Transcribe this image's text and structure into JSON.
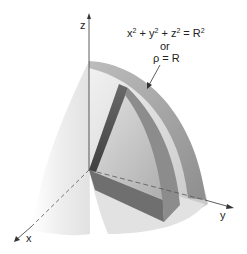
{
  "diagram": {
    "type": "3d-surface-illustration",
    "axes": {
      "z_label": "z",
      "x_label": "x",
      "y_label": "y"
    },
    "equation": {
      "line1_parts": [
        "x",
        "2",
        " + y",
        "2",
        " + z",
        "2",
        " = R",
        "2"
      ],
      "line2": "or",
      "line3": "ρ = R"
    },
    "colors": {
      "background": "#ffffff",
      "sphere_light": "#e6e6e6",
      "sphere_mid": "#c8c8c8",
      "wedge_dark": "#555555",
      "wedge_mid": "#9a9a9a",
      "axis": "#333333"
    }
  }
}
